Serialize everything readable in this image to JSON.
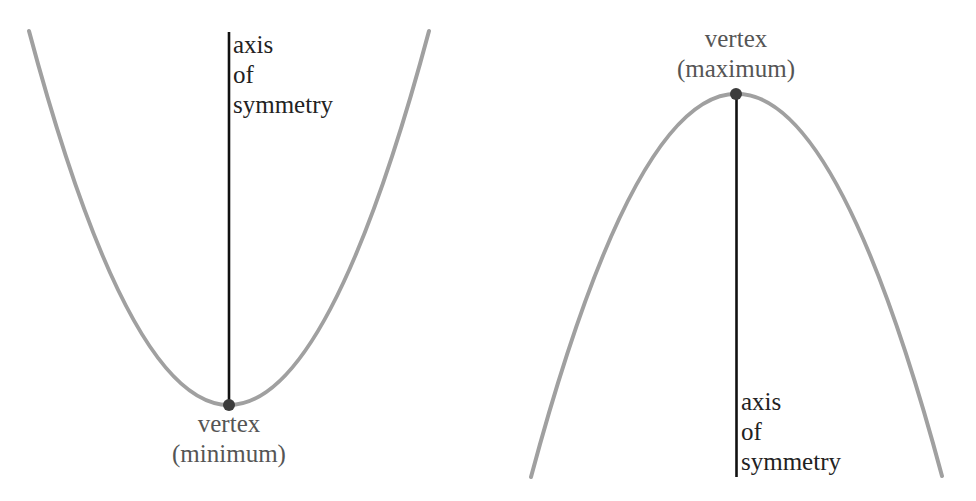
{
  "diagram": {
    "colors": {
      "curve": "#a0a0a0",
      "axis": "#111111",
      "vertex": "#3c3c3c",
      "label_axis": "#222222",
      "label_vertex": "#555555"
    },
    "left_parabola": {
      "orientation": "opens upward",
      "endpoints": [
        [
          29,
          31
        ],
        [
          429,
          31
        ]
      ],
      "vertex_px": [
        229,
        405
      ],
      "axis_label": {
        "line1": "axis",
        "line2": "of",
        "line3": "symmetry"
      },
      "vertex_label": {
        "line1": "vertex",
        "line2": "(minimum)"
      }
    },
    "right_parabola": {
      "orientation": "opens downward",
      "endpoints": [
        [
          531,
          477
        ],
        [
          942,
          476
        ]
      ],
      "vertex_px": [
        736,
        94
      ],
      "axis_label": {
        "line1": "axis",
        "line2": "of",
        "line3": "symmetry"
      },
      "vertex_label": {
        "line1": "vertex",
        "line2": "(maximum)"
      }
    }
  }
}
